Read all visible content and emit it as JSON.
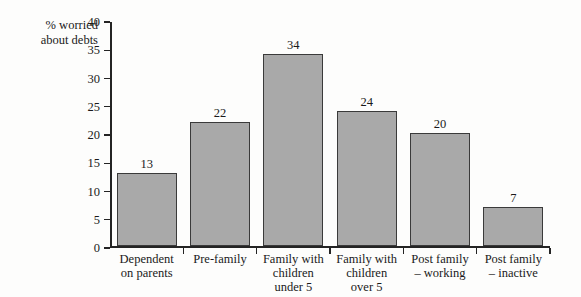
{
  "chart_data": {
    "type": "bar",
    "title": "",
    "xlabel": "",
    "ylabel": "% worried about debts",
    "ylabel_lines": [
      "% worried",
      "about debts"
    ],
    "categories": [
      "Dependent on parents",
      "Pre-family",
      "Family with children under 5",
      "Family with children over 5",
      "Post family – working",
      "Post family – inactive"
    ],
    "category_lines": [
      [
        "Dependent",
        "on parents"
      ],
      [
        "Pre-family"
      ],
      [
        "Family with",
        "children",
        "under 5"
      ],
      [
        "Family with",
        "children",
        "over 5"
      ],
      [
        "Post family",
        "– working"
      ],
      [
        "Post family",
        "– inactive"
      ]
    ],
    "values": [
      13,
      22,
      34,
      24,
      20,
      7
    ],
    "value_labels": [
      "13",
      "22",
      "34",
      "24",
      "20",
      "7"
    ],
    "ylim": [
      0,
      40
    ],
    "y_ticks": [
      0,
      5,
      10,
      15,
      20,
      25,
      30,
      35,
      40
    ],
    "y_tick_labels": [
      "0",
      "5",
      "10",
      "15",
      "20",
      "25",
      "30",
      "35",
      "40"
    ],
    "grid": false,
    "legend": false,
    "legend_position": "none",
    "bar_color": "#a9a9a9",
    "bar_edge_color": "#3a3a3a",
    "axis_color": "#242424",
    "background_color": "#fdfdfc"
  }
}
